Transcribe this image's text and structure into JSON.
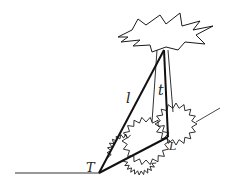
{
  "diagram": {
    "labels": {
      "l": "l",
      "t": "t",
      "T": "T",
      "L": "L"
    },
    "colors": {
      "stroke": "#1a1a1a",
      "background": "#ffffff"
    },
    "elements": [
      "starburst-top",
      "thick-line-l",
      "thick-line-t",
      "thick-line-base",
      "thin-strings",
      "ground-line",
      "slope-line",
      "zigzag-circle-left",
      "zigzag-circle-right"
    ]
  }
}
